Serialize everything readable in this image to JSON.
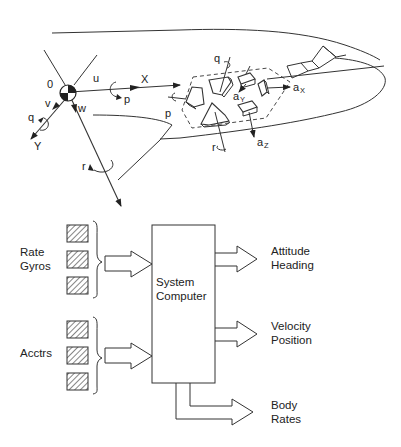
{
  "figure": {
    "aircraft": {
      "origin_label": "0",
      "axes": {
        "x": {
          "label": "X",
          "velocity": "u",
          "rate": "p"
        },
        "y": {
          "label": "Y",
          "velocity": "v",
          "rate": "q"
        },
        "z": {
          "velocity": "w",
          "rate": "r"
        }
      },
      "sensor_labels": {
        "roll_rate": "p",
        "pitch_rate": "q",
        "yaw_rate": "r",
        "accel_x": "a",
        "accel_x_sub": "X",
        "accel_y": "a",
        "accel_y_sub": "Y",
        "accel_z": "a",
        "accel_z_sub": "Z"
      }
    },
    "block_diagram": {
      "inputs": [
        {
          "line1": "Rate",
          "line2": "Gyros",
          "count": 3
        },
        {
          "line1": "Acctrs",
          "line2": "",
          "count": 3
        }
      ],
      "processor": {
        "line1": "System",
        "line2": "Computer"
      },
      "outputs": [
        {
          "line1": "Attitude",
          "line2": "Heading"
        },
        {
          "line1": "Velocity",
          "line2": "Position"
        },
        {
          "line1": "Body",
          "line2": "Rates"
        }
      ]
    }
  }
}
